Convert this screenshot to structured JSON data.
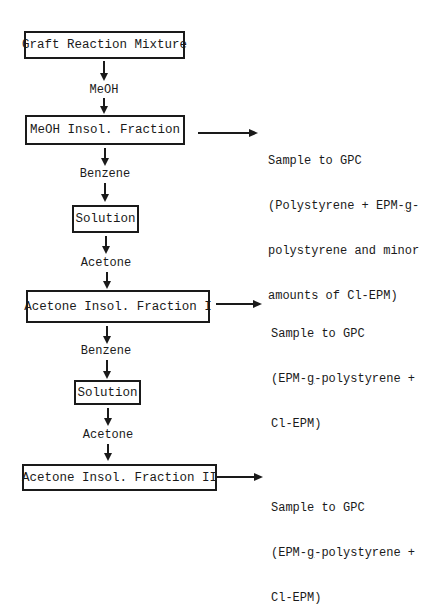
{
  "flowchart": {
    "nodes": [
      {
        "id": "graft",
        "label": "Graft Reaction Mixture"
      },
      {
        "id": "meoh_insol",
        "label": "MeOH Insol. Fraction"
      },
      {
        "id": "solution1",
        "label": "Solution"
      },
      {
        "id": "acetone_insol_1",
        "label": "Acetone Insol. Fraction I"
      },
      {
        "id": "solution2",
        "label": "Solution"
      },
      {
        "id": "acetone_insol_2",
        "label": "Acetone Insol. Fraction II"
      }
    ],
    "steps": [
      {
        "from": "graft",
        "to": "meoh_insol",
        "reagent": "MeOH"
      },
      {
        "from": "meoh_insol",
        "to": "solution1",
        "reagent": "Benzene"
      },
      {
        "from": "solution1",
        "to": "acetone_insol_1",
        "reagent": "Acetone"
      },
      {
        "from": "acetone_insol_1",
        "to": "solution2",
        "reagent": "Benzene"
      },
      {
        "from": "solution2",
        "to": "acetone_insol_2",
        "reagent": "Acetone"
      }
    ],
    "samples": [
      {
        "from": "meoh_insol",
        "line1": "Sample to GPC",
        "line2_pre": "(Polystyrene + EPM-",
        "line2_g": "g",
        "line2_post": "-",
        "line3": "polystyrene and minor",
        "line4": "amounts of Cl-EPM)"
      },
      {
        "from": "acetone_insol_1",
        "line1": "Sample to GPC",
        "line2_pre": "(EPM-",
        "line2_g": "g",
        "line2_post": "-polystyrene +",
        "line3": "Cl-EPM)"
      },
      {
        "from": "acetone_insol_2",
        "line1": "Sample to GPC",
        "line2_pre": "(EPM-",
        "line2_g": "g",
        "line2_post": "-polystyrene +",
        "line3": "Cl-EPM)"
      }
    ]
  }
}
